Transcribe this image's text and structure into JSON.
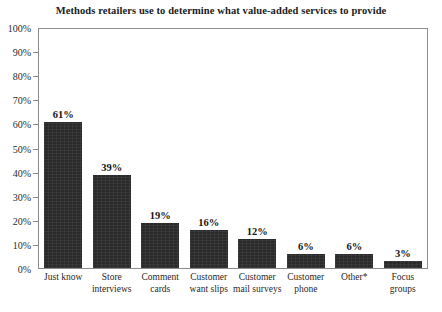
{
  "chart_data": {
    "type": "bar",
    "title": "Methods retailers use to determine what value-added services to provide",
    "xlabel": "",
    "ylabel": "",
    "ylim": [
      0,
      100
    ],
    "yticks": [
      "0%",
      "10%",
      "20%",
      "30%",
      "40%",
      "50%",
      "60%",
      "70%",
      "80%",
      "90%",
      "100%"
    ],
    "grid": false,
    "legend": false,
    "bar_color": "#2a2a2a",
    "categories": [
      "Just know",
      "Store interviews",
      "Comment cards",
      "Customer want slips",
      "Customer mail surveys",
      "Customer phone",
      "Other*",
      "Focus groups"
    ],
    "category_lines": [
      [
        "Just know",
        ""
      ],
      [
        "Store",
        "interviews"
      ],
      [
        "Comment",
        "cards"
      ],
      [
        "Customer",
        "want slips"
      ],
      [
        "Customer",
        "mail surveys"
      ],
      [
        "Customer",
        "phone"
      ],
      [
        "Other*",
        ""
      ],
      [
        "Focus",
        "groups"
      ]
    ],
    "values": [
      61,
      39,
      19,
      16,
      12,
      6,
      6,
      3
    ],
    "value_labels": [
      "61%",
      "39%",
      "19%",
      "16%",
      "12%",
      "6%",
      "6%",
      "3%"
    ]
  }
}
